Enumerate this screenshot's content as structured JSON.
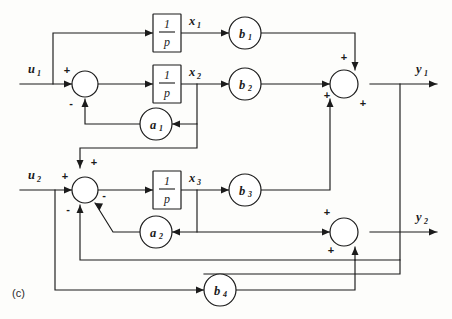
{
  "figure": {
    "panel_label": "(c)",
    "type": "block-diagram"
  },
  "colors": {
    "line": "#1b1b1b",
    "background": "#fdfdfb",
    "block_fill": "#ffffff"
  },
  "inputs": [
    {
      "id": "u1",
      "label": "u",
      "subscript": "1"
    },
    {
      "id": "u2",
      "label": "u",
      "subscript": "2"
    }
  ],
  "outputs": [
    {
      "id": "y1",
      "label": "y",
      "subscript": "1"
    },
    {
      "id": "y2",
      "label": "y",
      "subscript": "2"
    }
  ],
  "states": [
    {
      "id": "x1",
      "label": "x",
      "subscript": "1"
    },
    {
      "id": "x2",
      "label": "x",
      "subscript": "2"
    },
    {
      "id": "x3",
      "label": "x",
      "subscript": "3"
    }
  ],
  "integrators": [
    {
      "id": "int1",
      "numerator": "1",
      "denominator": "p"
    },
    {
      "id": "int2",
      "numerator": "1",
      "denominator": "p"
    },
    {
      "id": "int3",
      "numerator": "1",
      "denominator": "p"
    }
  ],
  "gains": [
    {
      "id": "b1",
      "label": "b",
      "subscript": "1"
    },
    {
      "id": "b2",
      "label": "b",
      "subscript": "2"
    },
    {
      "id": "b3",
      "label": "b",
      "subscript": "3"
    },
    {
      "id": "b4",
      "label": "b",
      "subscript": "4"
    },
    {
      "id": "a1",
      "label": "a",
      "subscript": "1"
    },
    {
      "id": "a2",
      "label": "a",
      "subscript": "2"
    }
  ],
  "summers": [
    {
      "id": "sum1",
      "signs": [
        {
          "port": "left",
          "sign": "+"
        },
        {
          "port": "bottom",
          "sign": "-"
        }
      ]
    },
    {
      "id": "sum2",
      "signs": [
        {
          "port": "left",
          "sign": "+"
        },
        {
          "port": "top",
          "sign": "+"
        },
        {
          "port": "bottom",
          "sign": "-"
        },
        {
          "port": "diagonal",
          "sign": "-"
        }
      ]
    },
    {
      "id": "sum_y1",
      "signs": [
        {
          "port": "top",
          "sign": "+"
        },
        {
          "port": "left",
          "sign": "+"
        },
        {
          "port": "bottom",
          "sign": "+"
        }
      ]
    },
    {
      "id": "sum_y2",
      "signs": [
        {
          "port": "left",
          "sign": "+"
        },
        {
          "port": "bottom",
          "sign": "+"
        }
      ]
    }
  ],
  "signs": {
    "plus": "+",
    "minus": "-"
  }
}
